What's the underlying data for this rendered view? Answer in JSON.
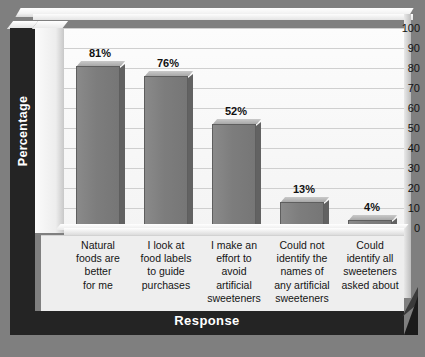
{
  "chart_data": {
    "type": "bar",
    "title": "",
    "xlabel": "Response",
    "ylabel": "Percentage",
    "ylim": [
      0,
      100
    ],
    "ytick_values": [
      100,
      90,
      80,
      70,
      60,
      50,
      40,
      30,
      20,
      10,
      0
    ],
    "grid": true,
    "legend": null,
    "categories": [
      "Natural foods are better for me",
      "I look at food labels to guide purchases",
      "I make an effort to avoid artificial sweeteners",
      "Could not identify the names of any artificial sweeteners",
      "Could identify all sweeteners asked about"
    ],
    "category_lines": [
      [
        "Natural",
        "foods are",
        "better",
        "for me"
      ],
      [
        "I look at",
        "food labels",
        "to guide",
        "purchases"
      ],
      [
        "I make an",
        "effort to",
        "avoid",
        "artificial",
        "sweeteners"
      ],
      [
        "Could not",
        "identify the",
        "names of",
        "any artificial",
        "sweeteners"
      ],
      [
        "Could",
        "identify all",
        "sweeteners",
        "asked about"
      ]
    ],
    "values": [
      81,
      76,
      52,
      13,
      4
    ],
    "value_labels": [
      "81%",
      "76%",
      "52%",
      "13%",
      "4%"
    ],
    "colors": {
      "bar_fill": "#7d7d7d",
      "bar_border": "#5e5e5e",
      "plot_background": "#f8f8f8",
      "gridline": "#cfcfcf",
      "axis_band": "#242424",
      "axis_band_text": "#ffffff",
      "outer_background": "#7f7f7f",
      "label_panel": "#eeeeee"
    }
  }
}
